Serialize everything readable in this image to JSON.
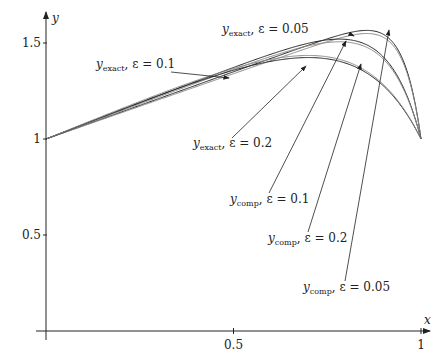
{
  "chart_data": {
    "type": "line",
    "title": "",
    "xlabel": "x",
    "ylabel": "y",
    "xlim": [
      0,
      1
    ],
    "ylim": [
      0,
      1.65
    ],
    "grid": false,
    "x_ticks": [
      "0.5",
      "1"
    ],
    "y_ticks": [
      "0.5",
      "1",
      "1.5"
    ],
    "series": [
      {
        "name": "y_exact, ε = 0.05",
        "color": "#222222",
        "k": 0.7,
        "eps": 0.05,
        "peak": [
          0.91,
          1.58
        ]
      },
      {
        "name": "y_comp, ε = 0.05",
        "color": "#888888",
        "k": 0.68,
        "eps": 0.05,
        "peak": [
          0.91,
          1.56
        ]
      },
      {
        "name": "y_exact, ε = 0.1",
        "color": "#222222",
        "k": 0.75,
        "eps": 0.1,
        "peak": [
          0.85,
          1.53
        ]
      },
      {
        "name": "y_comp, ε = 0.1",
        "color": "#888888",
        "k": 0.73,
        "eps": 0.1,
        "peak": [
          0.85,
          1.51
        ]
      },
      {
        "name": "y_exact, ε = 0.2",
        "color": "#222222",
        "k": 0.78,
        "eps": 0.2,
        "peak": [
          0.78,
          1.4
        ]
      },
      {
        "name": "y_comp, ε = 0.2",
        "color": "#888888",
        "k": 0.8,
        "eps": 0.2,
        "peak": [
          0.78,
          1.41
        ]
      }
    ],
    "annotations": [
      {
        "text_main": "y",
        "text_sub": "exact",
        "text_rest": ", ε = 0.05",
        "lx": 222,
        "ly": 33,
        "ax": 352,
        "ay": 35,
        "tx": 354,
        "ty": 36
      },
      {
        "text_main": "y",
        "text_sub": "exact",
        "text_rest": ", ε = 0.1",
        "lx": 96,
        "ly": 68,
        "ax": 171,
        "ay": 72,
        "tx": 229,
        "ty": 78
      },
      {
        "text_main": "y",
        "text_sub": "exact",
        "text_rest": ", ε = 0.2",
        "lx": 193,
        "ly": 147,
        "ax": 232,
        "ay": 138,
        "tx": 306,
        "ty": 66
      },
      {
        "text_main": "y",
        "text_sub": "comp",
        "text_rest": ", ε = 0.1",
        "lx": 230,
        "ly": 203,
        "ax": 269,
        "ay": 193,
        "tx": 346,
        "ty": 41
      },
      {
        "text_main": "y",
        "text_sub": "comp",
        "text_rest": ", ε = 0.2",
        "lx": 268,
        "ly": 242,
        "ax": 308,
        "ay": 232,
        "tx": 361,
        "ty": 64
      },
      {
        "text_main": "y",
        "text_sub": "comp",
        "text_rest": ", ε = 0.05",
        "lx": 303,
        "ly": 291,
        "ax": 345,
        "ay": 281,
        "tx": 389,
        "ty": 30
      }
    ]
  }
}
